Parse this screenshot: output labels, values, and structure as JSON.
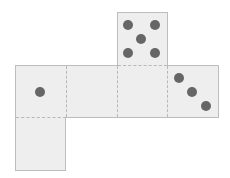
{
  "diagram": {
    "type": "cube-net",
    "colors": {
      "face": "#eeeeee",
      "outline": "#bdbdbd",
      "fold_line": "#b8b8b8",
      "pip": "#666666"
    },
    "faces": [
      {
        "id": "top",
        "pips": 5
      },
      {
        "id": "left",
        "pips": 1
      },
      {
        "id": "center-left",
        "pips": 0
      },
      {
        "id": "center-right",
        "pips": 0
      },
      {
        "id": "right",
        "pips": 3
      },
      {
        "id": "bottom",
        "pips": 0
      }
    ]
  }
}
